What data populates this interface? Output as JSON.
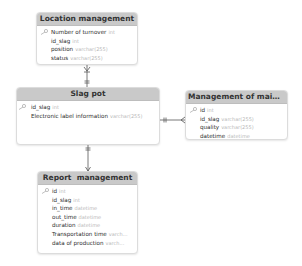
{
  "diagram": {
    "type": "entity-relationship",
    "tables": {
      "location": {
        "title": "Location management",
        "columns": [
          {
            "name": "Number of turnover",
            "type": "int",
            "key": true
          },
          {
            "name": "id_slag",
            "type": "int",
            "key": false
          },
          {
            "name": "position",
            "type": "varchar(255)",
            "key": false
          },
          {
            "name": "status",
            "type": "varchar(255)",
            "key": false
          }
        ]
      },
      "slag_pot": {
        "title": "Slag pot",
        "columns": [
          {
            "name": "id_slag",
            "type": "int",
            "key": true
          },
          {
            "name": "Electronic label information",
            "type": "varchar(255)",
            "key": false
          }
        ]
      },
      "maintenance": {
        "title": "Management of mainten...",
        "columns": [
          {
            "name": "id",
            "type": "int",
            "key": true
          },
          {
            "name": "id_slag",
            "type": "varchar(255)",
            "key": false
          },
          {
            "name": "quality",
            "type": "varchar(255)",
            "key": false
          },
          {
            "name": "datetime",
            "type": "datetime",
            "key": false
          }
        ]
      },
      "report": {
        "title": "Report  management",
        "columns": [
          {
            "name": "id",
            "type": "int",
            "key": true
          },
          {
            "name": "id_slag",
            "type": "int",
            "key": false
          },
          {
            "name": "in_time",
            "type": "datetime",
            "key": false
          },
          {
            "name": "out_time",
            "type": "datetime",
            "key": false
          },
          {
            "name": "duration",
            "type": "datetime",
            "key": false
          },
          {
            "name": "Transportation time",
            "type": "varch...",
            "key": false
          },
          {
            "name": "data of production",
            "type": "varch...",
            "key": false
          }
        ]
      }
    },
    "relationships": [
      {
        "from": "Location management",
        "to": "Slag pot",
        "from_end": "many",
        "to_end": "one"
      },
      {
        "from": "Slag pot",
        "to": "Management of mainten...",
        "from_end": "one",
        "to_end": "many"
      },
      {
        "from": "Slag pot",
        "to": "Report  management",
        "from_end": "one",
        "to_end": "many"
      }
    ],
    "colors": {
      "header_bg": "#c9c9c9",
      "border": "#dcdcdc",
      "type_text": "#b8b8b8",
      "line": "#555555"
    }
  }
}
